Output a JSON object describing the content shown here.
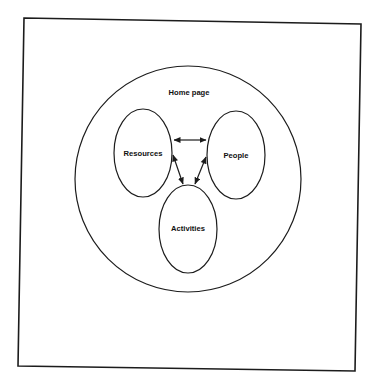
{
  "diagram": {
    "type": "nested-venn-navigation",
    "frame": {
      "stroke_color": "#1c1c1c"
    },
    "container": {
      "label": "Home page"
    },
    "nodes": [
      {
        "id": "resources",
        "label": "Resources"
      },
      {
        "id": "people",
        "label": "People"
      },
      {
        "id": "activities",
        "label": "Activities"
      }
    ],
    "edges": [
      {
        "from": "resources",
        "to": "people",
        "direction": "bidirectional"
      },
      {
        "from": "resources",
        "to": "activities",
        "direction": "bidirectional"
      },
      {
        "from": "people",
        "to": "activities",
        "direction": "bidirectional"
      }
    ]
  }
}
